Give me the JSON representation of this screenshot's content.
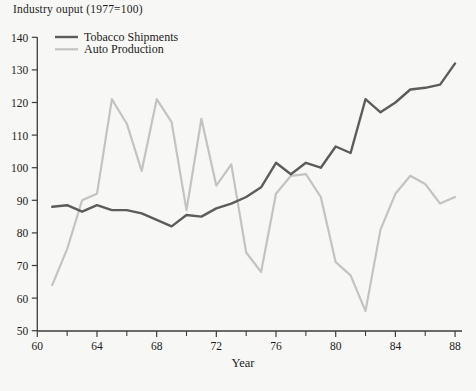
{
  "chart_data": {
    "type": "line",
    "title": "Industry ouput (1977=100)",
    "xlabel": "Year",
    "x": [
      1961,
      1962,
      1963,
      1964,
      1965,
      1966,
      1967,
      1968,
      1969,
      1970,
      1971,
      1972,
      1973,
      1974,
      1975,
      1976,
      1977,
      1978,
      1979,
      1980,
      1981,
      1982,
      1983,
      1984,
      1985,
      1986,
      1987,
      1988
    ],
    "series": [
      {
        "name": "Tobacco Shipments",
        "color": "#5c5c5c",
        "stroke_width": 2.4,
        "values": [
          88,
          88.5,
          86.5,
          88.5,
          87,
          87,
          86,
          84,
          82,
          85.5,
          85,
          87.5,
          89,
          91,
          94,
          101.5,
          98,
          101.5,
          100,
          106.5,
          104.5,
          121,
          117,
          120,
          124,
          124.5,
          125.5,
          132
        ]
      },
      {
        "name": "Auto Production",
        "color": "#c3c3c3",
        "stroke_width": 2.2,
        "values": [
          64,
          75,
          90,
          92,
          121,
          113.5,
          99,
          121,
          114,
          87,
          115,
          94.5,
          101,
          74,
          68,
          92,
          97.5,
          98,
          91,
          71,
          67,
          56,
          81,
          92,
          97.5,
          95,
          89,
          91
        ]
      }
    ],
    "axes": {
      "xlim": [
        60,
        88
      ],
      "ylim": [
        50,
        140
      ],
      "x_major_ticks": [
        60,
        64,
        68,
        72,
        76,
        80,
        84,
        88
      ],
      "x_minor_ticks": [
        62,
        66,
        70,
        74,
        78,
        82,
        86
      ],
      "y_ticks": [
        50,
        60,
        70,
        80,
        90,
        100,
        110,
        120,
        130,
        140
      ],
      "grid": false,
      "axis_color": "#3d3d3d",
      "text_color": "#1c1c1c"
    },
    "legend": {
      "position": "top-left-inside",
      "entries": [
        "Tobacco Shipments",
        "Auto Production"
      ]
    }
  }
}
